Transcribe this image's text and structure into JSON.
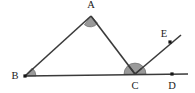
{
  "figure": {
    "background_color": "#ffffff",
    "stroke_color": "#3a3a3a",
    "angle_fill_color": "#9a9a9a",
    "angle_stroke_color": "#6f6f6f",
    "label_color": "#1a1a1a",
    "width": 195,
    "height": 93
  },
  "points": [
    {
      "name": "A",
      "label": "A",
      "x": 91,
      "y": 16,
      "label_x": 91,
      "label_y": 8,
      "has_dot": false
    },
    {
      "name": "B",
      "label": "B",
      "x": 25,
      "y": 76,
      "label_x": 15,
      "label_y": 79,
      "has_dot": true
    },
    {
      "name": "C",
      "label": "C",
      "x": 135,
      "y": 74,
      "label_x": 135,
      "label_y": 89,
      "has_dot": false
    },
    {
      "name": "D",
      "label": "D",
      "x": 172,
      "y": 74,
      "label_x": 172,
      "label_y": 89,
      "has_dot": true
    },
    {
      "name": "E",
      "label": "E",
      "x": 170,
      "y": 42,
      "label_x": 164,
      "label_y": 37,
      "has_dot": true
    }
  ],
  "segments": [
    {
      "name": "segment-BA",
      "from": "B",
      "to": "A",
      "x1": 25,
      "y1": 76,
      "x2": 91,
      "y2": 16
    },
    {
      "name": "segment-AC",
      "from": "A",
      "to": "C",
      "x1": 91,
      "y1": 16,
      "x2": 135,
      "y2": 74
    },
    {
      "name": "line-BD",
      "from": "B",
      "to": "end",
      "x1": 25,
      "y1": 76,
      "x2": 188,
      "y2": 74
    },
    {
      "name": "ray-CE",
      "from": "C",
      "to": "end",
      "x1": 135,
      "y1": 74,
      "x2": 181,
      "y2": 35
    }
  ],
  "angle_marks": [
    {
      "name": "angle-at-A",
      "vertex": "A",
      "kind": "wedge",
      "radius": 9,
      "path": "M 91 16 L 84.4 24.7 A 9 9 0 0 0 97.6 23.2 Z"
    },
    {
      "name": "angle-at-B",
      "vertex": "B",
      "kind": "wedge",
      "radius": 11,
      "path": "M 25 76 L 36 75.9 A 11 11 0 0 0 32.2 68.0 Z"
    },
    {
      "name": "angle-at-C",
      "vertex": "C",
      "kind": "semicircle",
      "radius": 11,
      "path": "M 124 74.1 A 11 11 0 0 1 146 74.1 Z"
    }
  ],
  "notch_lines": [
    {
      "name": "notch-C-to-A",
      "x1": 135,
      "y1": 74,
      "x2": 128.8,
      "y2": 65.9
    },
    {
      "name": "notch-C-to-E",
      "x1": 135,
      "y1": 74,
      "x2": 141.5,
      "y2": 68.5
    }
  ]
}
